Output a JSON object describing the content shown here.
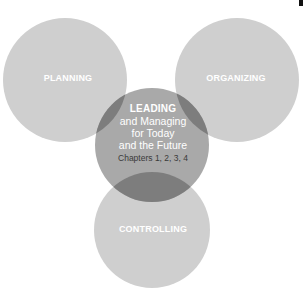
{
  "diagram": {
    "type": "venn",
    "colors": {
      "outer_circle": "#cfcfcf",
      "center_circle": "#a9a9a9",
      "overlap": "#7d7d7d",
      "background": "#ffffff"
    },
    "circles": [
      {
        "id": "planning",
        "label": "PLANNING"
      },
      {
        "id": "organizing",
        "label": "ORGANIZING"
      },
      {
        "id": "controlling",
        "label": "CONTROLLING"
      },
      {
        "id": "leading",
        "label": "LEADING",
        "lines": [
          "and Managing",
          "for Today",
          "and the Future"
        ],
        "chapters": "Chapters 1, 2, 3, 4"
      }
    ]
  }
}
